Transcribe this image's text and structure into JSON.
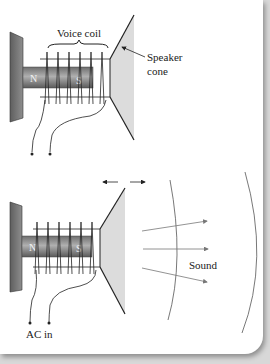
{
  "figure": {
    "top_diagram": {
      "label_voice_coil": "Voice coil",
      "label_speaker": "Speaker",
      "label_cone": "cone",
      "magnet_north": "N",
      "magnet_south": "S"
    },
    "bottom_diagram": {
      "magnet_north": "N",
      "magnet_south": "S",
      "label_sound": "Sound",
      "label_ac_in": "AC in"
    }
  },
  "colors": {
    "background": "#ffffff",
    "plate": "#7a7a7a",
    "magnet": "#8a8a8a",
    "cone": "#dcdcdc",
    "line": "#222222",
    "sound_arrow": "#777777"
  }
}
